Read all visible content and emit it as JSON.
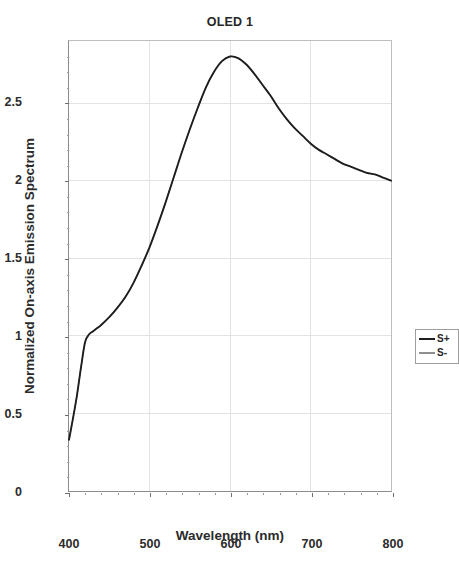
{
  "chart_data": {
    "type": "line",
    "title": "OLED 1",
    "xlabel": "Wavelength (nm)",
    "ylabel": "Normalized On-axis Emission Spectrum",
    "xlim": [
      400,
      800
    ],
    "ylim": [
      0,
      2.9
    ],
    "xticks": [
      400,
      500,
      600,
      700,
      800
    ],
    "xtick_labels": [
      "400",
      "500",
      "600",
      "700",
      "800"
    ],
    "yticks": [
      0,
      0.5,
      1,
      1.5,
      2,
      2.5
    ],
    "ytick_labels": [
      "0",
      "0.5",
      "1",
      "1.5",
      "2",
      "2.5"
    ],
    "grid": true,
    "legend_position": "center-right",
    "x": [
      400,
      405,
      410,
      415,
      420,
      425,
      430,
      435,
      440,
      450,
      460,
      470,
      480,
      490,
      500,
      510,
      520,
      530,
      540,
      550,
      560,
      570,
      580,
      590,
      600,
      610,
      620,
      630,
      640,
      650,
      660,
      670,
      680,
      690,
      700,
      710,
      720,
      730,
      740,
      750,
      760,
      770,
      780,
      790,
      800
    ],
    "series": [
      {
        "name": "S+",
        "color": "#1e1e1e",
        "values": [
          0.33,
          0.47,
          0.62,
          0.8,
          0.96,
          1.01,
          1.03,
          1.05,
          1.07,
          1.12,
          1.18,
          1.25,
          1.34,
          1.45,
          1.57,
          1.71,
          1.86,
          2.02,
          2.18,
          2.33,
          2.47,
          2.6,
          2.7,
          2.77,
          2.8,
          2.79,
          2.75,
          2.69,
          2.62,
          2.55,
          2.47,
          2.4,
          2.34,
          2.29,
          2.24,
          2.2,
          2.17,
          2.14,
          2.11,
          2.09,
          2.07,
          2.05,
          2.04,
          2.02,
          2.0
        ]
      },
      {
        "name": "S-",
        "color": "#8f8f8f",
        "values": [
          0.33,
          0.47,
          0.62,
          0.8,
          0.96,
          1.01,
          1.03,
          1.05,
          1.07,
          1.12,
          1.18,
          1.25,
          1.34,
          1.45,
          1.57,
          1.71,
          1.86,
          2.02,
          2.18,
          2.33,
          2.47,
          2.6,
          2.7,
          2.77,
          2.8,
          2.79,
          2.75,
          2.69,
          2.62,
          2.55,
          2.47,
          2.4,
          2.34,
          2.29,
          2.24,
          2.2,
          2.17,
          2.14,
          2.11,
          2.09,
          2.07,
          2.05,
          2.04,
          2.02,
          2.0
        ]
      }
    ],
    "annotations": []
  },
  "legend": {
    "entries": [
      {
        "label": "S+",
        "color": "#1e1e1e"
      },
      {
        "label": "S-",
        "color": "#8f8f8f"
      }
    ]
  },
  "colors": {
    "background": "#ffffff",
    "axis": "#8c8c8c",
    "grid": "#e3e3e3",
    "text": "#2b2b2b",
    "series_splus": "#1e1e1e",
    "series_sminus": "#8f8f8f"
  }
}
